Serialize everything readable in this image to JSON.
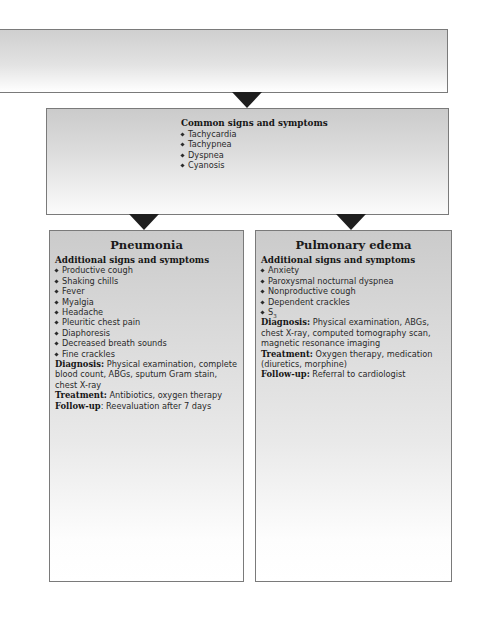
{
  "top_box": {
    "text": ""
  },
  "common": {
    "heading": "Common signs and symptoms",
    "items": [
      "Tachycardia",
      "Tachypnea",
      "Dyspnea",
      "Cyanosis"
    ]
  },
  "pneumonia": {
    "title": "Pneumonia",
    "subheading": "Additional signs and symptoms",
    "items": [
      "Productive cough",
      "Shaking chills",
      "Fever",
      "Myalgia",
      "Headache",
      "Pleuritic chest pain",
      "Diaphoresis",
      "Decreased breath sounds",
      "Fine crackles"
    ],
    "diagnosis_label": "Diagnosis:",
    "diagnosis": "Physical examination, complete blood count, ABGs, sputum Gram stain, chest X-ray",
    "treatment_label": "Treatment:",
    "treatment": "Antibiotics, oxygen therapy",
    "followup_label": "Follow-up",
    "followup": ": Reevaluation after 7 days"
  },
  "edema": {
    "title": "Pulmonary edema",
    "subheading": "Additional signs and symptoms",
    "items": [
      "Anxiety",
      "Paroxysmal nocturnal dyspnea",
      "Nonproductive cough",
      "Dependent crackles"
    ],
    "s3_letter": "S",
    "s3_sub": "3",
    "diagnosis_label": "Diagnosis:",
    "diagnosis": "Physical examination, ABGs, chest X-ray, computed tomography scan, magnetic resonance imaging",
    "treatment_label": "Treatment:",
    "treatment": "Oxygen therapy, medication (diuretics, morphine)",
    "followup_label": "Follow-up:",
    "followup": "Referral to cardiologist"
  },
  "colors": {
    "box_border": "#7a7a7a",
    "box_fill_top": "#cbcbcb",
    "box_fill_bottom": "#ffffff",
    "arrow": "#1e1e1e"
  }
}
